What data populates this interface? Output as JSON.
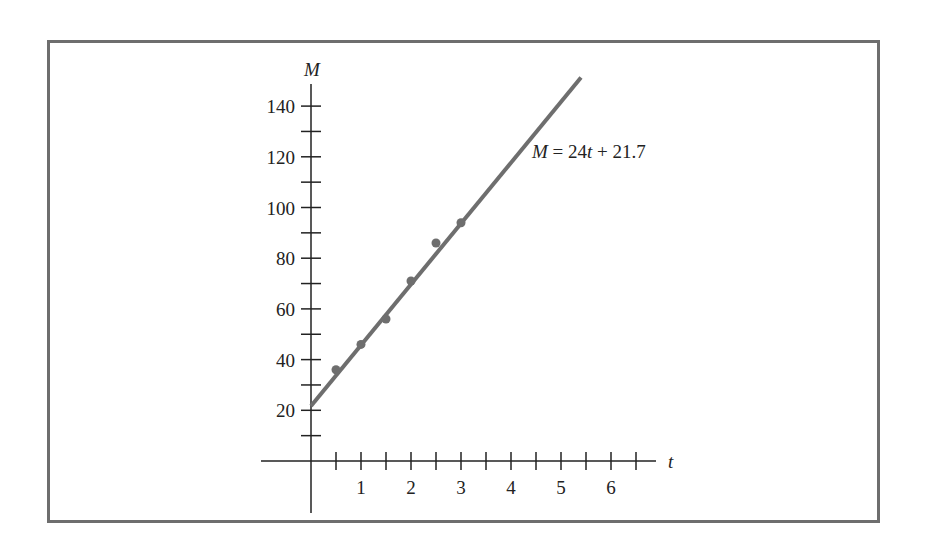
{
  "chart_data": {
    "type": "scatter",
    "title": "",
    "xlabel": "t",
    "ylabel": "M",
    "x_ticks": [
      1,
      2,
      3,
      4,
      5,
      6
    ],
    "x_minor_step": 0.5,
    "y_ticks": [
      20,
      40,
      60,
      80,
      100,
      120,
      140
    ],
    "y_minor_step": 10,
    "xlim": [
      -1,
      7
    ],
    "ylim": [
      -20,
      150
    ],
    "grid": false,
    "series": [
      {
        "name": "observations",
        "type": "scatter",
        "x": [
          0.5,
          1,
          1.5,
          2,
          2.5,
          3
        ],
        "y": [
          36,
          46,
          56,
          71,
          86,
          94
        ]
      },
      {
        "name": "fit",
        "type": "line",
        "slope": 24,
        "intercept": 21.7,
        "x_range": [
          0,
          5.4
        ]
      }
    ],
    "annotations": [
      {
        "text_parts": [
          "M",
          " = 24",
          "t",
          " + 21.7"
        ],
        "italic_parts": [
          0,
          2
        ],
        "x": 5.0,
        "y": 118
      }
    ],
    "colors": {
      "line": "#6e6e6e",
      "points": "#6e6e6e",
      "axes": "#222222",
      "frame": "#6e6e6e"
    }
  },
  "labels": {
    "y_axis": "M",
    "x_axis": "t",
    "equation": {
      "m": "M",
      "mid": " = 24",
      "t": "t",
      "end": " + 21.7"
    },
    "x_ticks": [
      "1",
      "2",
      "3",
      "4",
      "5",
      "6"
    ],
    "y_ticks": [
      "20",
      "40",
      "60",
      "80",
      "100",
      "120",
      "140"
    ]
  }
}
